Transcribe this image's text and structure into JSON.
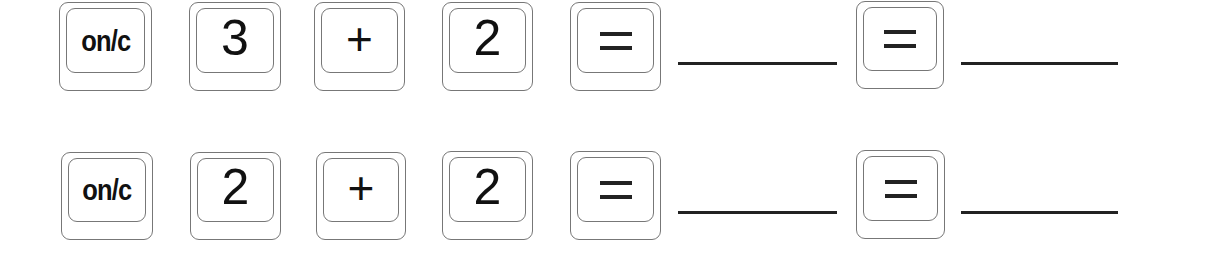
{
  "rows": [
    {
      "keys": [
        {
          "label": "on/c",
          "kind": "word"
        },
        {
          "label": "3",
          "kind": "num"
        },
        {
          "label": "+",
          "kind": "op"
        },
        {
          "label": "2",
          "kind": "num"
        },
        {
          "label": "=",
          "kind": "eq"
        },
        {
          "label": "=",
          "kind": "eq"
        }
      ],
      "blanks": [
        "",
        ""
      ]
    },
    {
      "keys": [
        {
          "label": "on/c",
          "kind": "word"
        },
        {
          "label": "2",
          "kind": "num"
        },
        {
          "label": "+",
          "kind": "op"
        },
        {
          "label": "2",
          "kind": "num"
        },
        {
          "label": "=",
          "kind": "eq"
        },
        {
          "label": "=",
          "kind": "eq"
        }
      ],
      "blanks": [
        "",
        ""
      ]
    }
  ]
}
